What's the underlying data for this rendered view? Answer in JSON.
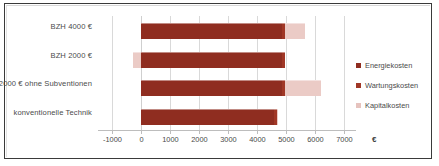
{
  "chart_data": {
    "type": "bar",
    "orientation": "horizontal",
    "stacked": true,
    "title": "",
    "xlabel": "€",
    "ylabel": "",
    "xlim": [
      -1500,
      7400
    ],
    "xticks": [
      -1000,
      0,
      1000,
      2000,
      3000,
      4000,
      5000,
      6000,
      7000
    ],
    "xticklabels": [
      "-1000",
      "0",
      "1000",
      "2000",
      "3000",
      "4000",
      "5000",
      "6000",
      "7000"
    ],
    "grid": true,
    "legend_position": "right",
    "categories": [
      "BZH 4000 €",
      "BZH 2000 €",
      "BZH 2000 € ohne Subventionen",
      "konventionelle Technik"
    ],
    "series": [
      {
        "name": "Energiekosten",
        "color": "#8f2d20",
        "values": [
          4850,
          4850,
          4850,
          4580
        ]
      },
      {
        "name": "Wartungskosten",
        "color": "#a03726",
        "values": [
          100,
          100,
          100,
          100
        ]
      },
      {
        "name": "Kapitalkosten",
        "color": "#ebcbc6",
        "values": [
          700,
          -300,
          1250,
          30
        ]
      }
    ]
  },
  "axis": {
    "unit": "€",
    "ticks": [
      "-1000",
      "0",
      "1000",
      "2000",
      "3000",
      "4000",
      "5000",
      "6000",
      "7000"
    ]
  },
  "categories": [
    {
      "label": "BZH 4000 €"
    },
    {
      "label": "BZH 2000 €"
    },
    {
      "label": "BZH 2000 € ohne Subventionen"
    },
    {
      "label": "konventionelle Technik"
    }
  ],
  "legend": [
    {
      "label": "Energiekosten",
      "color": "#8f2d20"
    },
    {
      "label": "Wartungskosten",
      "color": "#a03726"
    },
    {
      "label": "Kapitalkosten",
      "color": "#e6c3be"
    }
  ]
}
